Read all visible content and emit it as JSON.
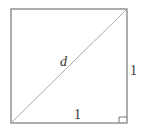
{
  "diagram": {
    "shape": "unit square with diagonal",
    "labels": {
      "diagonal": "d",
      "side_right": "1",
      "side_bottom": "1"
    },
    "marker": "right-angle",
    "colors": {
      "stroke": "#777777",
      "diagonal": "#aaaaaa",
      "text": "#333333"
    }
  }
}
